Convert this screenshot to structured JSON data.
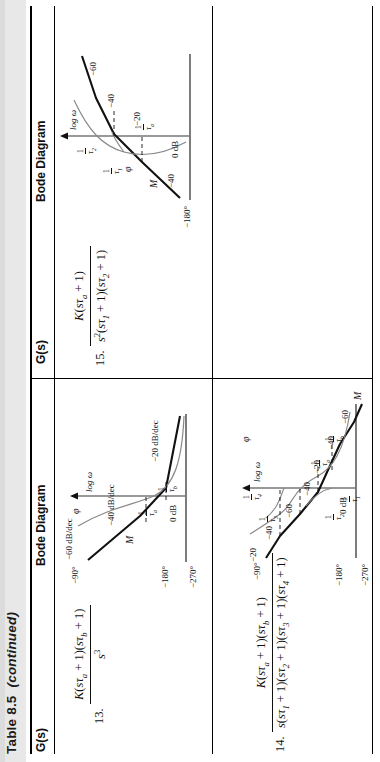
{
  "page": {
    "table_title": "Table 8.5",
    "table_title_continued": "(continued)",
    "background": "#ffffff",
    "rule_color": "#000000"
  },
  "columns": {
    "gs_header": "G(s)",
    "bode_header": "Bode Diagram"
  },
  "entries": [
    {
      "index": "13.",
      "numerator": "K(sτa + 1)(sτb + 1)",
      "denominator": "s³",
      "bode": {
        "phase_ticks": [
          "−90°",
          "−180°",
          "−270°"
        ],
        "magnitude_label": "M",
        "phase_label": "φ",
        "zero_db": "0 dB",
        "x_axis": "log ω",
        "slopes": [
          "−60 dB/dec",
          "−40 dB/dec",
          "−20 dB/dec"
        ],
        "break_frequencies": [
          "1/τa",
          "1/τb"
        ]
      }
    },
    {
      "index": "14.",
      "numerator": "K(sτa + 1)(sτb + 1)",
      "denominator": "s(sτ1 + 1)(sτ2 + 1)(sτ3 + 1)(sτ4 + 1)",
      "bode": {
        "phase_ticks": [
          "−90°",
          "−180°",
          "−270°"
        ],
        "magnitude_label": "M",
        "phase_label": "φ",
        "zero_db": "0 dB",
        "x_axis": "log ω",
        "slopes": [
          "−20",
          "−40",
          "−60",
          "−40",
          "−20",
          "−40",
          "−60"
        ],
        "break_frequencies": [
          "1/τ1",
          "1/τ2",
          "1/τa",
          "1/τb",
          "1/τ3",
          "1/τ4"
        ]
      }
    },
    {
      "index": "15.",
      "numerator": "K(sτa + 1)",
      "denominator": "s²(sτ1 + 1)(sτ2 + 1)",
      "bode": {
        "phase_ticks": [
          "−180°"
        ],
        "magnitude_label": "M",
        "phase_label": "φ",
        "zero_db": "0 dB",
        "x_axis": "log ω",
        "slopes": [
          "−40",
          "−20",
          "−40",
          "−60"
        ],
        "break_frequencies": [
          "1/τa",
          "1/τ1",
          "1/τ2"
        ]
      }
    }
  ]
}
